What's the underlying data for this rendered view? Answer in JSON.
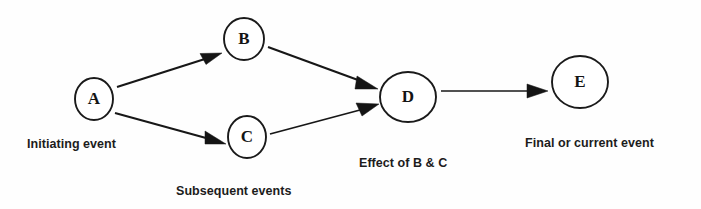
{
  "diagram": {
    "type": "event-chain-flow-diagram",
    "background_color": "#fefefe",
    "stroke_color": "#171717",
    "nodes": [
      {
        "id": "A",
        "label": "A",
        "cx": 94,
        "cy": 99,
        "rx": 19,
        "ry": 21
      },
      {
        "id": "B",
        "label": "B",
        "cx": 244,
        "cy": 39,
        "rx": 20,
        "ry": 21
      },
      {
        "id": "C",
        "label": "C",
        "cx": 247,
        "cy": 137,
        "rx": 19,
        "ry": 21
      },
      {
        "id": "D",
        "label": "D",
        "cx": 408,
        "cy": 97,
        "rx": 28,
        "ry": 25
      },
      {
        "id": "E",
        "label": "E",
        "cx": 580,
        "cy": 82,
        "rx": 28,
        "ry": 26
      }
    ],
    "edges": [
      {
        "id": "a-to-b",
        "from": "A",
        "to": "B"
      },
      {
        "id": "a-to-c",
        "from": "A",
        "to": "C"
      },
      {
        "id": "b-to-d",
        "from": "B",
        "to": "D"
      },
      {
        "id": "c-to-d",
        "from": "C",
        "to": "D"
      },
      {
        "id": "d-to-e",
        "from": "D",
        "to": "E"
      }
    ],
    "captions": {
      "initiating": "Initiating event",
      "subsequent": "Subsequent events",
      "effect": "Effect of B & C",
      "final": "Final or current event"
    }
  }
}
